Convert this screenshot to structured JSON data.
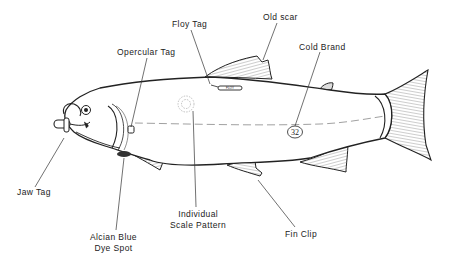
{
  "diagram": {
    "colors": {
      "ink": "#222222",
      "background": "#ffffff",
      "fin_hatch": "#555555"
    },
    "labels": [
      {
        "id": "floy-tag",
        "text": "Floy Tag",
        "x": 172,
        "y": 19
      },
      {
        "id": "old-scar",
        "text": "Old scar",
        "x": 263,
        "y": 12
      },
      {
        "id": "opercular-tag",
        "text": "Opercular Tag",
        "x": 117,
        "y": 47
      },
      {
        "id": "cold-brand",
        "text": "Cold Brand",
        "x": 299,
        "y": 42
      },
      {
        "id": "jaw-tag",
        "text": "Jaw Tag",
        "x": 17,
        "y": 187
      },
      {
        "id": "alcian-blue-dye-spot",
        "line1": "Alcian Blue",
        "line2": "Dye Spot",
        "x": 90,
        "y": 232
      },
      {
        "id": "individual-scale-pattern",
        "line1": "Individual",
        "line2": "Scale Pattern",
        "x": 170,
        "y": 209
      },
      {
        "id": "fin-clip",
        "text": "Fin Clip",
        "x": 285,
        "y": 229
      }
    ],
    "cold_brand_number": "32",
    "floy_tag_text": "FLOY"
  }
}
